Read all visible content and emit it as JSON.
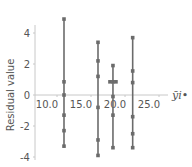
{
  "chart_data": {
    "type": "scatter",
    "title": "",
    "xlabel": "ȳi•",
    "ylabel": "Residual value",
    "xlim": [
      7.5,
      28.5
    ],
    "ylim": [
      -4.2,
      5.5
    ],
    "x_ticks": [
      "10.0",
      "15.0",
      "20.0",
      "25.0"
    ],
    "x_tick_values": [
      10,
      15,
      20,
      25
    ],
    "y_ticks": [
      "4",
      "2",
      "0",
      "-2",
      "-4"
    ],
    "y_tick_values": [
      4,
      2,
      0,
      -2,
      -4
    ],
    "grid": false,
    "legend": null,
    "style": {
      "point_color": "#6b6b6b",
      "line_color": "#6b6b6b",
      "axis_color": "#c8c8c8"
    },
    "series": [
      {
        "name": "group-1",
        "x": 12.5,
        "values": [
          4.9,
          0.85,
          0.0,
          -1.3,
          -2.3,
          -3.3
        ]
      },
      {
        "name": "group-2",
        "x": 17.5,
        "values": [
          3.4,
          2.2,
          1.2,
          -0.8,
          -2.9,
          -3.9
        ]
      },
      {
        "name": "group-3",
        "x": 19.7,
        "values": [
          1.9,
          0.85,
          0.85,
          -0.1,
          -1.3,
          -3.4
        ]
      },
      {
        "name": "group-4",
        "x": 22.6,
        "values": [
          3.7,
          1.55,
          0.8,
          -1.4,
          -2.5,
          -3.4
        ]
      }
    ]
  }
}
